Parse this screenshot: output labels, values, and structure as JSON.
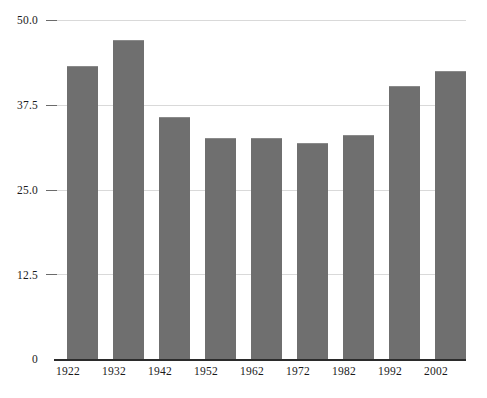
{
  "chart_data": {
    "type": "bar",
    "title": "",
    "subtitle": "",
    "xlabel": "",
    "ylabel": "",
    "categories": [
      "1922",
      "1932",
      "1942",
      "1952",
      "1962",
      "1972",
      "1982",
      "1992",
      "2002"
    ],
    "values": [
      43.2,
      47.0,
      35.7,
      32.6,
      32.6,
      31.8,
      33.0,
      40.3,
      42.5
    ],
    "ylim": [
      0,
      50
    ],
    "ytick_labels": [
      "50.0",
      "37.5",
      "25.0",
      "12.5",
      "0"
    ],
    "ytick_values": [
      50,
      37.5,
      25,
      12.5,
      0
    ],
    "grid": true,
    "legend": "none",
    "bar_color": "#6f6f6f",
    "grid_color": "#d9d9d9",
    "axis_color": "#2b2b2b",
    "background_color": "#ffffff"
  }
}
